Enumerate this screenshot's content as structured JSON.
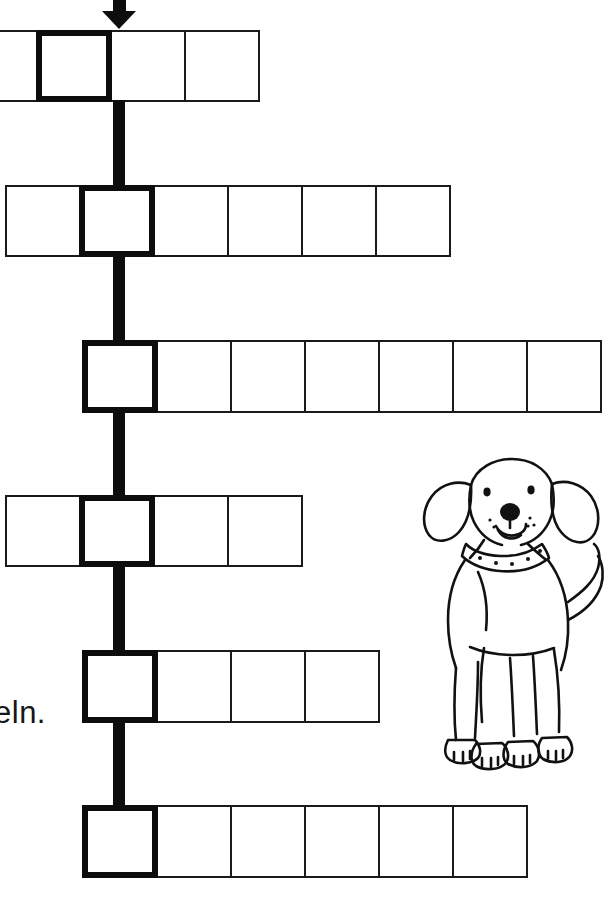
{
  "page": {
    "width": 614,
    "height": 902,
    "background_color": "#ffffff",
    "ink_color": "#0d0d0d",
    "type": "word-chain-worksheet"
  },
  "arrow": {
    "name": "entry-arrow",
    "direction": "down",
    "color": "#0d0d0d"
  },
  "text_fragment": {
    "value": "eln.",
    "note": "cut off at left page edge"
  },
  "puzzle": {
    "key_column_x": 119,
    "rows": [
      {
        "index": 1,
        "cell_count": 4,
        "key_cell_index": 1,
        "left": -38,
        "top": 30,
        "cell_width": 76,
        "cell_height": 72,
        "clipped_left": true
      },
      {
        "index": 2,
        "cell_count": 6,
        "key_cell_index": 1,
        "left": 5,
        "top": 185,
        "cell_width": 76,
        "cell_height": 72,
        "clipped_left": false
      },
      {
        "index": 3,
        "cell_count": 7,
        "key_cell_index": 0,
        "left": 82,
        "top": 340,
        "cell_width": 76,
        "cell_height": 73,
        "clipped_right": true
      },
      {
        "index": 4,
        "cell_count": 4,
        "key_cell_index": 1,
        "left": 5,
        "top": 495,
        "cell_width": 76,
        "cell_height": 72,
        "clipped_left": false
      },
      {
        "index": 5,
        "cell_count": 4,
        "key_cell_index": 0,
        "left": 82,
        "top": 650,
        "cell_width": 76,
        "cell_height": 73,
        "clipped_left": false
      },
      {
        "index": 6,
        "cell_count": 6,
        "key_cell_index": 0,
        "left": 82,
        "top": 805,
        "cell_width": 76,
        "cell_height": 73,
        "clipped_left": false
      }
    ],
    "connectors": [
      {
        "top": 100,
        "height": 88
      },
      {
        "top": 255,
        "height": 88
      },
      {
        "top": 410,
        "height": 88
      },
      {
        "top": 565,
        "height": 88
      },
      {
        "top": 720,
        "height": 88
      }
    ]
  },
  "illustration": {
    "name": "dog-drawing",
    "subject": "dog",
    "style": "hand-drawn line art",
    "features": [
      "floppy ears",
      "studded collar",
      "upturned tail",
      "four paws",
      "dot eyes",
      "dark nose"
    ],
    "left": 418,
    "top": 452,
    "width": 190,
    "height": 330
  }
}
